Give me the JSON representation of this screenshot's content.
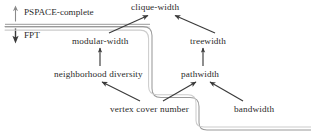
{
  "diagram": {
    "colors": {
      "text": "#2b2b2b",
      "arrow": "#3a3a3a",
      "boundary_dark": "#6e6e6e",
      "boundary_light": "#bdbdbd",
      "background": "#ffffff"
    },
    "axis": {
      "upper_region_label": "PSPACE-complete",
      "lower_region_label": "FPT",
      "up_arrow_icon": "up-arrow-icon",
      "down_arrow_icon": "down-arrow-icon",
      "divider_icon": "horizontal-divider"
    },
    "nodes": [
      {
        "id": "clique-width",
        "label": "clique-width"
      },
      {
        "id": "modular-width",
        "label": "modular-width"
      },
      {
        "id": "treewidth",
        "label": "treewidth"
      },
      {
        "id": "neighborhood-diversity",
        "label": "neighborhood diversity"
      },
      {
        "id": "pathwidth",
        "label": "pathwidth"
      },
      {
        "id": "vertex-cover-number",
        "label": "vertex cover number"
      },
      {
        "id": "bandwidth",
        "label": "bandwidth"
      }
    ],
    "edges": [
      {
        "from": "modular-width",
        "to": "clique-width"
      },
      {
        "from": "treewidth",
        "to": "clique-width"
      },
      {
        "from": "neighborhood-diversity",
        "to": "modular-width"
      },
      {
        "from": "pathwidth",
        "to": "treewidth"
      },
      {
        "from": "vertex-cover-number",
        "to": "neighborhood-diversity"
      },
      {
        "from": "vertex-cover-number",
        "to": "pathwidth"
      },
      {
        "from": "bandwidth",
        "to": "pathwidth"
      }
    ],
    "boundary": {
      "description": "staircase double-line separating PSPACE-complete region (upper-left) from FPT region (lower-right)"
    }
  }
}
